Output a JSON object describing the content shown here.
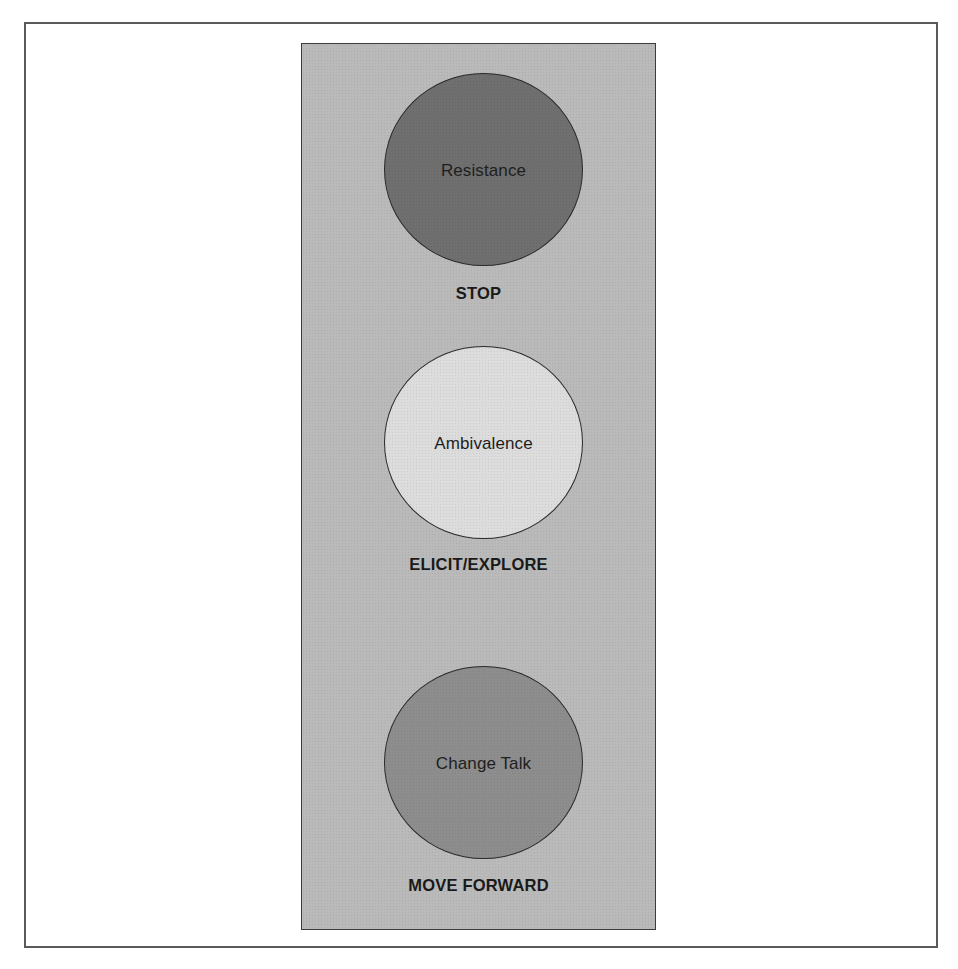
{
  "diagram": {
    "type": "traffic-light",
    "colors": {
      "background": "#ffffff",
      "frame_border": "#5a5a5a",
      "panel_fill": "#b9b9b9",
      "panel_border": "#3c3c3c",
      "text": "#1a1a1a"
    },
    "lights": [
      {
        "label": "Resistance",
        "action": "STOP",
        "fill": "#6f6f6f"
      },
      {
        "label": "Ambivalence",
        "action": "ELICIT/EXPLORE",
        "fill": "#dcdcdc"
      },
      {
        "label": "Change Talk",
        "action": "MOVE FORWARD",
        "fill": "#8d8d8d"
      }
    ]
  }
}
